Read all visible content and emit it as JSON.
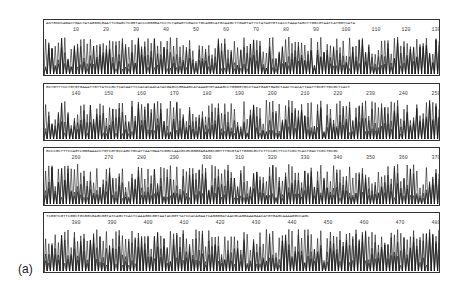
{
  "figure": {
    "panel_label": "(a)",
    "trace_color": "#1a1a1a",
    "panels": [
      {
        "sequence": "ANTGNNKAGACTGACTATAGGGCGAATTCGAGCTCGGTACCCGGGGATCCTCTAGAGTCGACCTGCAGGCATGCAAGCTTGAGTATTCTATAGTGTCACCTAAATAGCTTGGCGTAATCATGGTCATA",
        "ticks": [
          "10",
          "20",
          "30",
          "40",
          "50",
          "60",
          "70",
          "80",
          "90",
          "100",
          "110",
          "120",
          "130"
        ],
        "tick_start": 10,
        "tick_end": 130
      },
      {
        "sequence": "GCTGTTTCCTGTGTGAAATTGTTATCCGCTCACAATTCCACACAACATACGAGCCGGAAGCATAAAGTGTAAAGCCTGGGGTGCCTAATGAGTGAGCTAACTCACATTAATTGCGTTGCGCTCACT",
        "ticks": [
          "140",
          "150",
          "160",
          "170",
          "180",
          "190",
          "200",
          "210",
          "220",
          "230",
          "240",
          "250"
        ],
        "tick_start": 140,
        "tick_end": 250
      },
      {
        "sequence": "GCCCGCTTTCCAGTCGGGAAACCTGTCGTGCCAGCTGCATTAATGAATCGGCCAACGCGCGGGGAGAGGCGGTTTGCGTATTGGGCGCTCTTCCGCTTCCTCGCTCACTGACTCGCTGCGC",
        "ticks": [
          "260",
          "270",
          "280",
          "290",
          "300",
          "310",
          "320",
          "330",
          "340",
          "350",
          "360",
          "370"
        ],
        "tick_start": 260,
        "tick_end": 370
      },
      {
        "sequence": "TCGGTCGTTCGGCTGCGGCGAGCGGTATCAGCTCACTCAAAGGCGGTAATACGGTTATCCACAGAATCAGGGGATAACGCAGGAAAGAACATGTGAGCAAAAGGCCAGC",
        "ticks": [
          "380",
          "390",
          "400",
          "410",
          "420",
          "430",
          "440",
          "450",
          "460",
          "470",
          "480"
        ],
        "tick_start": 380,
        "tick_end": 480
      }
    ]
  }
}
